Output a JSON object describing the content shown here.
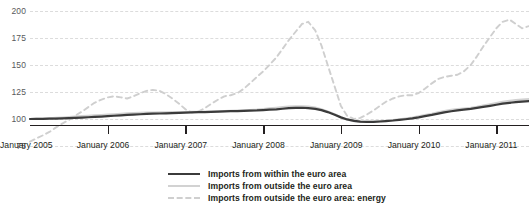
{
  "chart_data": {
    "type": "line",
    "title": "",
    "subtitle": "",
    "xlabel": "",
    "ylabel": "",
    "ylim": [
      75,
      200
    ],
    "yticks": [
      75,
      100,
      125,
      150,
      175,
      200
    ],
    "ytick_labels": [
      "75",
      "100",
      "125",
      "150",
      "175",
      "200"
    ],
    "grid": true,
    "legend_position": "bottom-center",
    "xtick_labels": [
      "January 2005",
      "January 2006",
      "January 2007",
      "January 2008",
      "January 2009",
      "January 2010",
      "January 2011"
    ],
    "x_start": "January 2005",
    "x_end": "mid 2011",
    "x": [
      2005.0,
      2005.08,
      2005.17,
      2005.25,
      2005.33,
      2005.42,
      2005.5,
      2005.58,
      2005.67,
      2005.75,
      2005.83,
      2005.92,
      2006.0,
      2006.08,
      2006.17,
      2006.25,
      2006.33,
      2006.42,
      2006.5,
      2006.58,
      2006.67,
      2006.75,
      2006.83,
      2006.92,
      2007.0,
      2007.08,
      2007.17,
      2007.25,
      2007.33,
      2007.42,
      2007.5,
      2007.58,
      2007.67,
      2007.75,
      2007.83,
      2007.92,
      2008.0,
      2008.08,
      2008.17,
      2008.25,
      2008.33,
      2008.42,
      2008.5,
      2008.58,
      2008.67,
      2008.75,
      2008.83,
      2008.92,
      2009.0,
      2009.08,
      2009.17,
      2009.25,
      2009.33,
      2009.42,
      2009.5,
      2009.58,
      2009.67,
      2009.75,
      2009.83,
      2009.92,
      2010.0,
      2010.08,
      2010.17,
      2010.25,
      2010.33,
      2010.42,
      2010.5,
      2010.58,
      2010.67,
      2010.75,
      2010.83,
      2010.92,
      2011.0,
      2011.08,
      2011.17,
      2011.25,
      2011.33,
      2011.42
    ],
    "series": [
      {
        "name": "Imports from within the euro area",
        "style": "solid",
        "color": "#3b3b3b",
        "values": [
          100.0,
          100.1,
          100.2,
          100.3,
          100.4,
          100.6,
          100.8,
          101.0,
          101.3,
          101.6,
          101.9,
          102.2,
          102.6,
          103.0,
          103.4,
          103.8,
          104.1,
          104.4,
          104.7,
          104.9,
          105.1,
          105.3,
          105.5,
          105.7,
          105.9,
          106.1,
          106.3,
          106.4,
          106.6,
          106.8,
          107.0,
          107.2,
          107.3,
          107.5,
          107.7,
          107.9,
          108.2,
          108.6,
          109.0,
          109.5,
          110.0,
          110.3,
          110.4,
          110.1,
          109.4,
          108.2,
          106.4,
          104.0,
          101.5,
          99.6,
          98.3,
          97.6,
          97.3,
          97.4,
          97.7,
          98.1,
          98.6,
          99.2,
          99.8,
          100.6,
          101.5,
          102.6,
          103.8,
          105.0,
          106.2,
          107.2,
          108.0,
          108.7,
          109.4,
          110.3,
          111.2,
          112.2,
          113.2,
          114.2,
          115.0,
          115.6,
          116.1,
          116.6
        ]
      },
      {
        "name": "Imports from outside the euro area",
        "style": "solid",
        "color": "#d2d2d2",
        "values": [
          100.0,
          100.2,
          100.4,
          100.7,
          101.0,
          101.4,
          101.8,
          102.2,
          102.6,
          103.0,
          103.4,
          103.7,
          104.0,
          104.4,
          104.8,
          105.2,
          105.5,
          105.7,
          105.9,
          106.0,
          106.1,
          106.2,
          106.3,
          106.4,
          106.5,
          106.6,
          106.7,
          106.8,
          106.9,
          107.1,
          107.3,
          107.5,
          107.7,
          108.0,
          108.3,
          108.7,
          109.2,
          109.8,
          110.4,
          111.0,
          111.5,
          111.8,
          111.8,
          111.4,
          110.5,
          109.0,
          107.0,
          104.3,
          101.6,
          99.5,
          98.1,
          97.4,
          97.2,
          97.4,
          97.8,
          98.3,
          98.9,
          99.6,
          100.4,
          101.3,
          102.4,
          103.6,
          104.9,
          106.2,
          107.4,
          108.4,
          109.1,
          109.7,
          110.4,
          111.3,
          112.4,
          113.6,
          114.8,
          115.9,
          116.8,
          117.5,
          118.0,
          118.4
        ]
      },
      {
        "name": "Imports from outside the euro area: energy",
        "style": "dashed",
        "color": "#cfcfcf",
        "values": [
          79.0,
          82.0,
          85.0,
          88.0,
          92.0,
          96.0,
          99.0,
          103.0,
          107.0,
          111.0,
          115.0,
          118.0,
          120.0,
          121.0,
          120.0,
          119.0,
          121.0,
          124.0,
          126.0,
          127.0,
          126.0,
          123.0,
          119.0,
          114.0,
          109.0,
          106.0,
          107.0,
          110.0,
          114.0,
          118.0,
          121.0,
          122.0,
          124.0,
          128.0,
          133.0,
          139.0,
          144.0,
          150.0,
          157.0,
          165.0,
          173.0,
          181.0,
          188.0,
          190.0,
          182.0,
          168.0,
          150.0,
          130.0,
          112.0,
          103.0,
          100.0,
          101.0,
          104.0,
          108.0,
          112.0,
          116.0,
          119.0,
          121.0,
          122.0,
          122.0,
          124.0,
          128.0,
          133.0,
          137.0,
          139.0,
          140.0,
          141.0,
          144.0,
          150.0,
          158.0,
          167.0,
          176.0,
          184.0,
          190.0,
          192.0,
          188.0,
          184.0,
          186.0
        ]
      }
    ]
  },
  "legend": {
    "items": [
      {
        "label": "Imports from within the euro area",
        "swatch": "solid-dark"
      },
      {
        "label": "Imports from outside the euro area",
        "swatch": "solid-light"
      },
      {
        "label": "Imports from outside the euro area: energy",
        "swatch": "dashed-light"
      }
    ]
  },
  "colors": {
    "within_euro_area": "#3b3b3b",
    "outside_euro_area": "#d2d2d2",
    "outside_euro_area_energy": "#cfcfcf",
    "axis": "#231f20",
    "grid": "#dcdcdc",
    "background": "#ffffff"
  }
}
